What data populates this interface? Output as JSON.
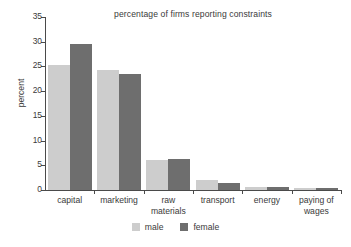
{
  "chart_data": {
    "type": "bar",
    "title": "percentage of firms reporting constraints",
    "xlabel": "",
    "ylabel": "percent",
    "ylim": [
      0,
      35
    ],
    "yticks": [
      0,
      5,
      10,
      15,
      20,
      25,
      30,
      35
    ],
    "grid": false,
    "legend_position": "bottom",
    "categories": [
      "capital",
      "marketing",
      "raw materials",
      "transport",
      "energy",
      "paying of wages"
    ],
    "category_lines": [
      [
        "capital"
      ],
      [
        "marketing"
      ],
      [
        "raw",
        "materials"
      ],
      [
        "transport"
      ],
      [
        "energy"
      ],
      [
        "paying of",
        "wages"
      ]
    ],
    "series": [
      {
        "name": "male",
        "color": "#cdcdcd",
        "values": [
          25.2,
          24.3,
          6.0,
          2.1,
          0.7,
          0.5
        ]
      },
      {
        "name": "female",
        "color": "#6e6e6e",
        "values": [
          29.5,
          23.4,
          6.3,
          1.5,
          0.7,
          0.4
        ]
      }
    ]
  },
  "legend": {
    "items": [
      {
        "label": "male",
        "color": "#cdcdcd"
      },
      {
        "label": "female",
        "color": "#6e6e6e"
      }
    ]
  }
}
